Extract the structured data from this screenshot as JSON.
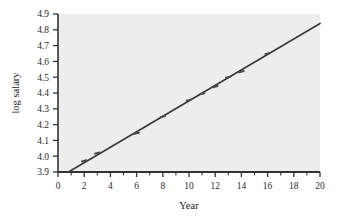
{
  "chart_data": {
    "type": "scatter",
    "title": "",
    "subtitle": "",
    "xlabel": "Year",
    "ylabel": "log salary",
    "xlim": [
      0,
      20
    ],
    "ylim": [
      3.9,
      4.9
    ],
    "grid": false,
    "legend": null,
    "background_color": "#ededed",
    "series": [
      {
        "name": "observations",
        "marker": "small-dash",
        "color": "#4a4a4a",
        "x": [
          2,
          3,
          6,
          8,
          10,
          11,
          12,
          13,
          14,
          16
        ],
        "y": [
          3.97,
          4.02,
          4.145,
          4.25,
          4.355,
          4.395,
          4.44,
          4.5,
          4.535,
          4.65
        ]
      },
      {
        "name": "fitted regression line",
        "type": "line",
        "color": "#3b3b3b",
        "x_start": 0.8,
        "y_start": 3.9,
        "x_end": 20,
        "y_end": 4.84
      }
    ],
    "x_ticks_major": [
      0,
      2,
      4,
      6,
      8,
      10,
      12,
      14,
      16,
      18,
      20
    ],
    "x_tick_labels": [
      "0",
      "2",
      "4",
      "6",
      "8",
      "10",
      "12",
      "14",
      "16",
      "18",
      "20"
    ],
    "x_ticks_minor_step": 1,
    "y_ticks": [
      3.9,
      4.0,
      4.1,
      4.2,
      4.3,
      4.4,
      4.5,
      4.6,
      4.7,
      4.8,
      4.9
    ],
    "y_tick_labels": [
      "3.9",
      "4.0",
      "4.1",
      "4.2",
      "4.3",
      "4.4",
      "4.5",
      "4.6",
      "4.7",
      "4.8",
      "4.9"
    ]
  },
  "axes": {
    "x_title": "Year",
    "y_title": "log salary"
  },
  "colors": {
    "plot_background": "#ededed",
    "axis": "#333333",
    "line": "#3b3b3b",
    "marker": "#4a4a4a",
    "text": "#222222"
  }
}
